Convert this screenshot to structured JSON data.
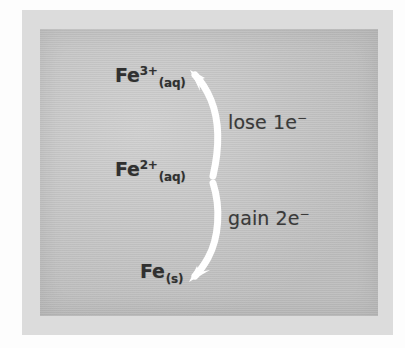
{
  "figure": {
    "colors": {
      "page_background": "#ffffff",
      "frame_band": "#dcdcdc",
      "panel_background": "#c8c8c8",
      "text": "#303030",
      "arrow": "#ffffff"
    }
  },
  "species": [
    {
      "id": "iron-iii",
      "symbol": "Fe",
      "charge": "3+",
      "state": "(aq)",
      "full_text": "Fe3+(aq)"
    },
    {
      "id": "iron-ii",
      "symbol": "Fe",
      "charge": "2+",
      "state": "(aq)",
      "full_text": "Fe2+(aq)"
    },
    {
      "id": "iron-metal",
      "symbol": "Fe",
      "charge": "",
      "state": "(s)",
      "full_text": "Fe(s)"
    }
  ],
  "processes": [
    {
      "id": "oxidation",
      "text": "lose 1e",
      "superscript": "−",
      "full_text": "lose 1e⁻",
      "direction": "up"
    },
    {
      "id": "reduction",
      "text": "gain 2e",
      "superscript": "−",
      "full_text": "gain 2e⁻",
      "direction": "down"
    }
  ],
  "arrows": [
    {
      "id": "arrow-lose-electron",
      "points_to": "iron-iii",
      "style": "curved-white"
    },
    {
      "id": "arrow-gain-electron",
      "points_to": "iron-metal",
      "style": "curved-white"
    }
  ]
}
